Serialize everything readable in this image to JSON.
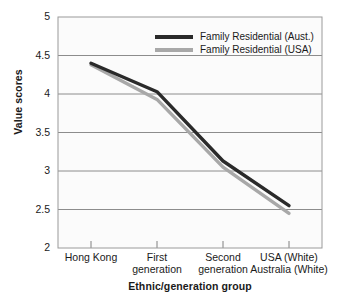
{
  "chart_data": {
    "type": "line",
    "title": "",
    "xlabel": "Ethnic/generation group",
    "ylabel": "Value scores",
    "categories": [
      "Hong Kong",
      "First generation",
      "Second generation",
      "USA (White) Australia (White)"
    ],
    "category_lines": [
      [
        "Hong Kong"
      ],
      [
        "First",
        "generation"
      ],
      [
        "Second",
        "generation"
      ],
      [
        "USA (White)",
        "Australia (White)"
      ]
    ],
    "ylim": [
      2,
      5
    ],
    "yticks": [
      "2",
      "2.5",
      "3",
      "3.5",
      "4",
      "4.5",
      "5"
    ],
    "ytick_values": [
      2,
      2.5,
      3,
      3.5,
      4,
      4.5,
      5
    ],
    "grid": true,
    "legend_position": "top-right-inside",
    "series": [
      {
        "name": "Family Residential (Aust.)",
        "color": "#2a2a2a",
        "values": [
          4.4,
          4.03,
          3.13,
          2.55
        ]
      },
      {
        "name": "Family Residential (USA)",
        "color": "#a8a8a8",
        "values": [
          4.38,
          3.93,
          3.05,
          2.45
        ]
      }
    ]
  },
  "colors": {
    "series_aust": "#2a2a2a",
    "series_usa": "#a8a8a8",
    "plot_background": "#fbfbfb",
    "grid": "#8c8c8c",
    "axis": "#808080",
    "text": "#1a1a1a"
  }
}
